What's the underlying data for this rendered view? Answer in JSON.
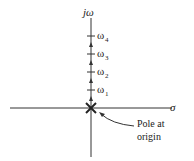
{
  "diagram": {
    "vertical_axis_label": "jω",
    "horizontal_axis_label": "σ",
    "ticks": [
      {
        "label": "ω",
        "sub": "1",
        "y": 90
      },
      {
        "label": "ω",
        "sub": "2",
        "y": 72
      },
      {
        "label": "ω",
        "sub": "3",
        "y": 54
      },
      {
        "label": "ω",
        "sub": "4",
        "y": 36
      }
    ],
    "annotation_line1": "Pole at",
    "annotation_line2": "origin",
    "colors": {
      "stroke": "#333333",
      "text": "#222222",
      "background": "#ffffff"
    }
  }
}
